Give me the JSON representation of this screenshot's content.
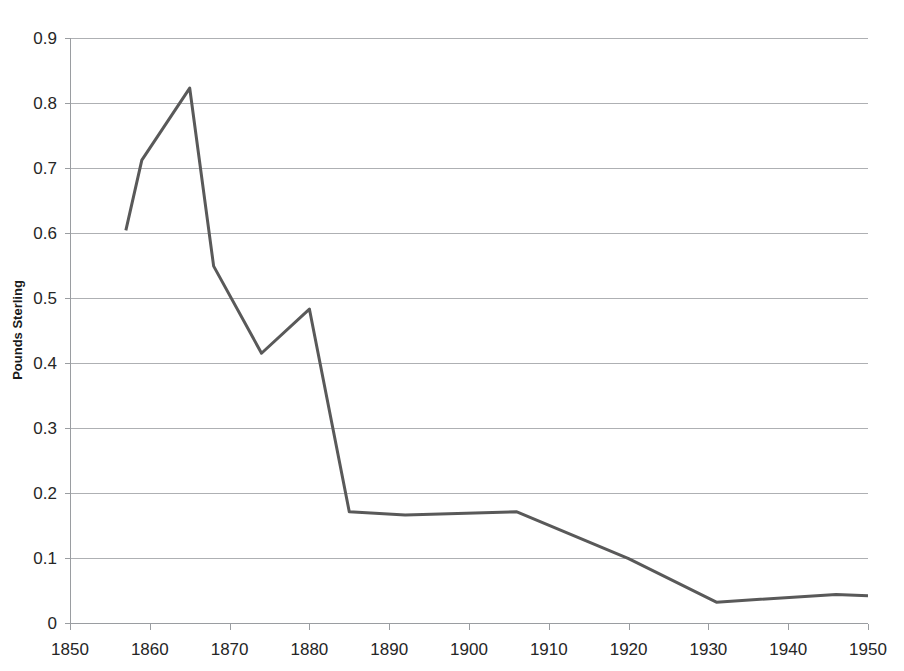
{
  "chart_data": {
    "type": "line",
    "title": "",
    "subtitle": "",
    "xlabel": "",
    "ylabel": "Pounds Sterling",
    "xlim": [
      1850,
      1950
    ],
    "ylim": [
      0,
      0.9
    ],
    "grid": true,
    "legend": false,
    "legend_position": "none",
    "x_ticks": [
      1850,
      1860,
      1870,
      1880,
      1890,
      1900,
      1910,
      1920,
      1930,
      1940,
      1950
    ],
    "x_tick_labels": [
      "1850",
      "1860",
      "1870",
      "1880",
      "1890",
      "1900",
      "1910",
      "1920",
      "1930",
      "1940",
      "1950"
    ],
    "y_ticks": [
      0,
      0.1,
      0.2,
      0.3,
      0.4,
      0.5,
      0.6,
      0.7,
      0.8,
      0.9
    ],
    "y_tick_labels": [
      "0",
      "0.1",
      "0.2",
      "0.3",
      "0.4",
      "0.5",
      "0.6",
      "0.7",
      "0.8",
      "0.9"
    ],
    "series": [
      {
        "name": "Pounds Sterling",
        "color": "#595959",
        "x": [
          1857,
          1859,
          1865,
          1868,
          1874,
          1880,
          1885,
          1892,
          1906,
          1920,
          1931,
          1946,
          1950
        ],
        "values": [
          0.604,
          0.712,
          0.823,
          0.549,
          0.415,
          0.483,
          0.171,
          0.166,
          0.171,
          0.099,
          0.032,
          0.044,
          0.042
        ]
      }
    ]
  },
  "colors": {
    "series_line": "#595959",
    "gridline": "#aeb0b3",
    "axis": "#9a9da1",
    "tick_text": "#262626",
    "axis_title": "#1a1a1a",
    "background": "#ffffff"
  },
  "plot_geometry": {
    "left": 70,
    "right": 868,
    "top": 38,
    "bottom": 623
  }
}
